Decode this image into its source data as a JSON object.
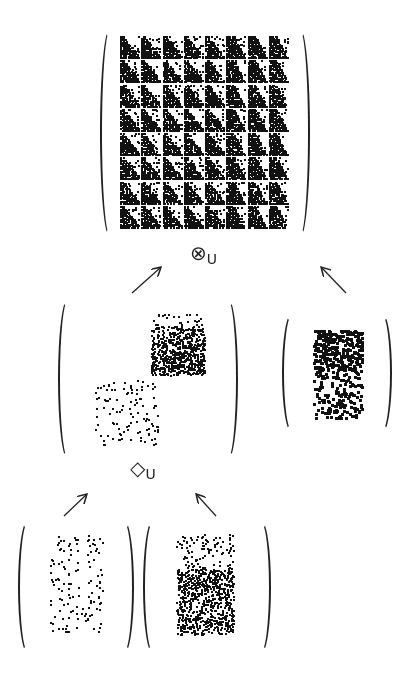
{
  "diagram": {
    "type": "matrix-composition-tree",
    "matrices": [
      {
        "id": "result",
        "label": "Kronecker-like product result",
        "pattern": "dense-blocks",
        "grid": [
          8,
          8
        ],
        "box": {
          "x": 100,
          "y": 28,
          "w": 210,
          "h": 210
        }
      },
      {
        "id": "mid-left",
        "label": "diamond-product result",
        "pattern": "sparse-two-blocks",
        "box": {
          "x": 58,
          "y": 298,
          "w": 180,
          "h": 162
        }
      },
      {
        "id": "mid-right",
        "label": "right factor",
        "pattern": "cross-blocks",
        "box": {
          "x": 282,
          "y": 313,
          "w": 110,
          "h": 120
        }
      },
      {
        "id": "bottom-left",
        "label": "left sparse factor",
        "pattern": "sparse-dots",
        "box": {
          "x": 18,
          "y": 520,
          "w": 116,
          "h": 134
        }
      },
      {
        "id": "bottom-right",
        "label": "right block factor",
        "pattern": "staircase-blocks",
        "box": {
          "x": 143,
          "y": 520,
          "w": 128,
          "h": 134
        }
      }
    ],
    "operators": [
      {
        "id": "otimes-u",
        "symbol": "⊗",
        "subscript": "U",
        "x": 190,
        "y": 243
      },
      {
        "id": "diamond-u",
        "symbol": "◇",
        "subscript": "U",
        "x": 130,
        "y": 458
      }
    ],
    "arrows": [
      {
        "from": [
          132,
          293
        ],
        "to": [
          160,
          268
        ]
      },
      {
        "from": [
          346,
          293
        ],
        "to": [
          322,
          268
        ]
      },
      {
        "from": [
          64,
          516
        ],
        "to": [
          86,
          495
        ]
      },
      {
        "from": [
          216,
          516
        ],
        "to": [
          197,
          495
        ]
      }
    ]
  }
}
